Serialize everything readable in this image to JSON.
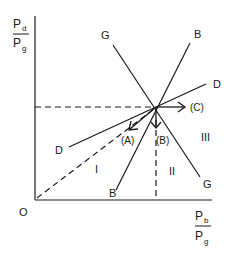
{
  "diagram": {
    "y_axis": {
      "numerator": "P",
      "numerator_sub": "d",
      "denominator": "P",
      "denominator_sub": "g"
    },
    "x_axis": {
      "numerator": "P",
      "numerator_sub": "b",
      "denominator": "P",
      "denominator_sub": "g"
    },
    "origin_label": "O",
    "lines": [
      {
        "name": "G",
        "label_top": "G",
        "label_bottom": "G"
      },
      {
        "name": "B",
        "label_top": "B",
        "label_bottom": "B"
      },
      {
        "name": "D",
        "label_top": "D",
        "label_bottom": "D"
      }
    ],
    "arrows": [
      {
        "id": "A",
        "label": "(A)"
      },
      {
        "id": "B",
        "label": "(B)"
      },
      {
        "id": "C",
        "label": "(C)"
      }
    ],
    "regions": [
      {
        "id": "I",
        "label": "I"
      },
      {
        "id": "II",
        "label": "II"
      },
      {
        "id": "III",
        "label": "III"
      }
    ],
    "colors": {
      "ink": "#1a1a1a",
      "background": "#ffffff"
    }
  }
}
